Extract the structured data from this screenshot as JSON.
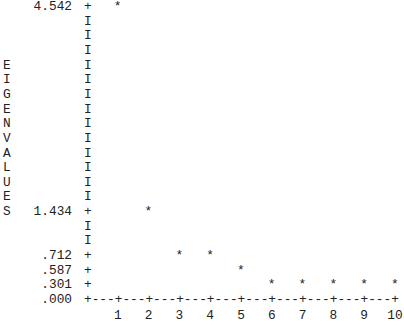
{
  "chart_data": {
    "type": "scatter",
    "title": "",
    "xlabel": "",
    "ylabel": "EIGENVALUES",
    "categories": [
      1,
      2,
      3,
      4,
      5,
      6,
      7,
      8,
      9,
      10
    ],
    "x": [
      1,
      2,
      3,
      4,
      5,
      6,
      7,
      8,
      9,
      10
    ],
    "values": [
      4.542,
      1.434,
      0.712,
      0.712,
      0.587,
      0.301,
      0.301,
      0.301,
      0.301,
      0.301
    ],
    "y_tick_labels": [
      "4.542",
      "1.434",
      ".712",
      ".587",
      ".301",
      ".000"
    ],
    "x_tick_labels": [
      "1",
      "2",
      "3",
      "4",
      "5",
      "6",
      "7",
      "8",
      "9",
      "10"
    ],
    "marker": "*",
    "ylim": [
      0,
      4.542
    ],
    "grid": false,
    "style": "text scree plot"
  },
  "ylabel_letters": [
    "E",
    "I",
    "G",
    "E",
    "N",
    "V",
    "A",
    "L",
    "U",
    "E",
    "S"
  ],
  "axis": {
    "x_axis_line": "+---+---+---+---+---+---+---+---+---+---+",
    "y_axis_bar": "I",
    "tick_mark": "+"
  }
}
